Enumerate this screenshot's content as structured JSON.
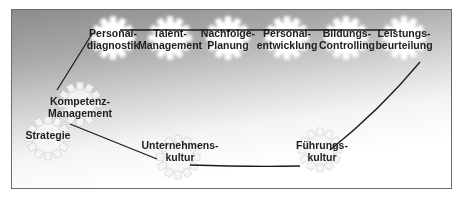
{
  "diagram": {
    "top_row": [
      {
        "id": "personaldiagnostik",
        "line1": "Personal-",
        "line2": "diagnostik",
        "x": 113,
        "y": 38
      },
      {
        "id": "talent-management",
        "line1": "Talent-",
        "line2": "Management",
        "x": 170,
        "y": 38
      },
      {
        "id": "nachfolgeplanung",
        "line1": "Nachfolge-",
        "line2": "Planung",
        "x": 228,
        "y": 38
      },
      {
        "id": "personalentwicklung",
        "line1": "Personal-",
        "line2": "entwicklung",
        "x": 287,
        "y": 38
      },
      {
        "id": "bildungscontrolling",
        "line1": "Bildungs-",
        "line2": "Controlling",
        "x": 346,
        "y": 38
      },
      {
        "id": "leistungsbeurteilung",
        "line1": "Leistungs-",
        "line2": "beurteilung",
        "x": 404,
        "y": 38
      }
    ],
    "lower": [
      {
        "id": "kompetenzmanagement",
        "line1": "Kompetenz-",
        "line2": "Management",
        "x": 80,
        "y": 106
      },
      {
        "id": "strategie",
        "line1": "Strategie",
        "line2": "",
        "x": 48,
        "y": 135
      },
      {
        "id": "unternehmenskultur",
        "line1": "Unternehmens-",
        "line2": "kultur",
        "x": 180,
        "y": 155
      },
      {
        "id": "fuehrungskultur",
        "line1": "Führungs-",
        "line2": "kultur",
        "x": 322,
        "y": 150
      }
    ],
    "colors": {
      "line": "#1a1a1a",
      "gear_fill": "#ffffff",
      "gear_outline": "#c8c8c8",
      "frame": "#6a6a6a"
    }
  }
}
